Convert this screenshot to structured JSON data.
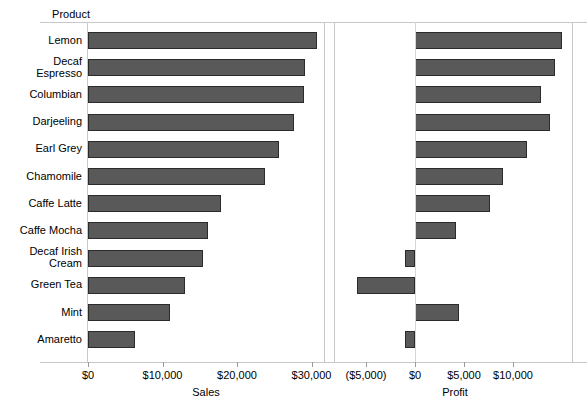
{
  "chart_data": {
    "type": "bar",
    "orientation": "horizontal",
    "title": "",
    "dimension_label": "Product",
    "categories": [
      "Lemon",
      "Decaf Espresso",
      "Columbian",
      "Darjeeling",
      "Earl Grey",
      "Chamomile",
      "Caffe Latte",
      "Caffe Mocha",
      "Decaf Irish Cream",
      "Green Tea",
      "Mint",
      "Amaretto"
    ],
    "panels": [
      {
        "id": "sales",
        "xlabel": "Sales",
        "measure": "Sales",
        "values": [
          30800,
          29100,
          29050,
          27600,
          25600,
          23700,
          17900,
          16100,
          15500,
          13000,
          11000,
          6300
        ],
        "xlim": [
          0,
          32000
        ],
        "ticks": [
          0,
          10000,
          20000,
          30000
        ],
        "tick_labels": [
          "$0",
          "$10,000",
          "$20,000",
          "$30,000"
        ],
        "grid": false
      },
      {
        "id": "profit",
        "xlabel": "Profit",
        "measure": "Profit",
        "values": [
          15000,
          14300,
          12900,
          13800,
          11400,
          9000,
          7700,
          4200,
          -1000,
          -5900,
          4500,
          -1000
        ],
        "xlim": [
          -6400,
          16100
        ],
        "ticks": [
          -5000,
          0,
          5000,
          10000
        ],
        "tick_labels": [
          "($5,000)",
          "$0",
          "$5,000",
          "$10,000"
        ],
        "grid": false,
        "zero_reference": 0
      }
    ],
    "colors": {
      "bar_fill": "#595959",
      "bar_border": "#2b2b2b",
      "axis_line": "#c8c8c8",
      "text": "#000000",
      "background": "#ffffff"
    },
    "sort": "descending by Sales",
    "legend": null
  }
}
